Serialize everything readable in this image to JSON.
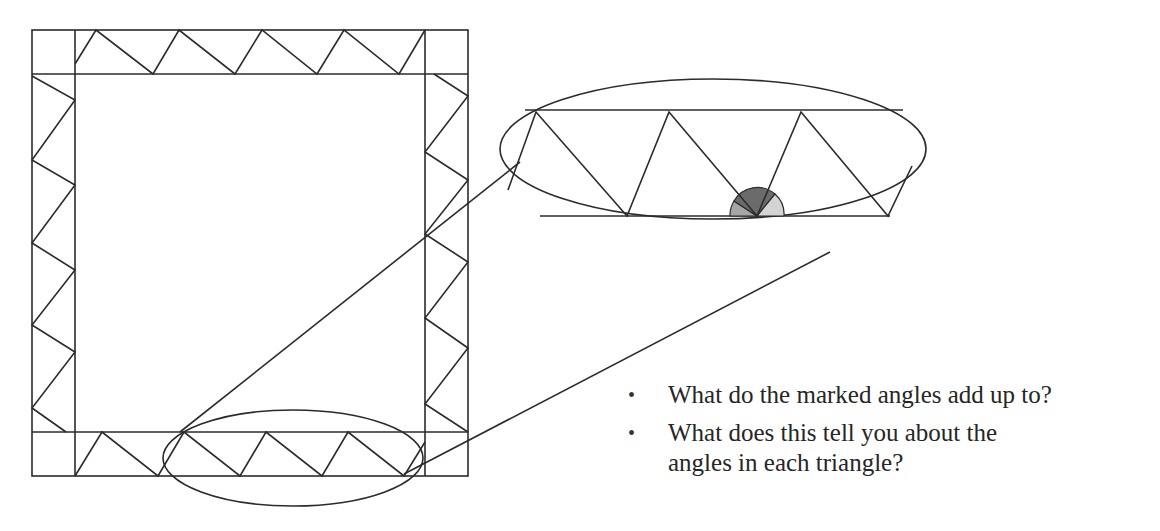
{
  "figure": {
    "stroke_color": "#2b2b2b",
    "angle_colors": {
      "left_angle": "#a6a6a6",
      "middle_angle": "#6b6b6b",
      "right_angle": "#d4d4d4"
    }
  },
  "questions": [
    {
      "bullet": "•",
      "text": "What do the marked angles add up to?"
    },
    {
      "bullet": "•",
      "text": "What does this tell you about the angles in each triangle?"
    }
  ]
}
